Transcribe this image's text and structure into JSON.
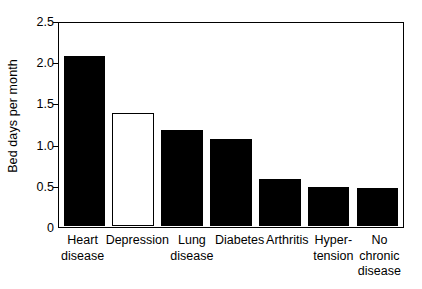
{
  "chart_data": {
    "type": "bar",
    "title": "",
    "subtitle": "",
    "xlabel": "",
    "ylabel": "Bed days per month",
    "ylim": [
      0,
      2.5
    ],
    "ytick_labels": [
      "2.5",
      "2.0",
      "1.5",
      "1.0",
      "0.5",
      "0"
    ],
    "ytick_values": [
      2.5,
      2.0,
      1.5,
      1.0,
      0.5,
      0
    ],
    "grid": false,
    "legend": null,
    "categories": [
      "Heart\ndisease",
      "Depression",
      "Lung\ndisease",
      "Diabetes",
      "Arthritis",
      "Hyper-\ntension",
      "No\nchronic\ndisease"
    ],
    "values": [
      2.1,
      1.4,
      1.19,
      1.08,
      0.58,
      0.48,
      0.47
    ],
    "bar_styles": [
      "filled",
      "open",
      "filled",
      "filled",
      "filled",
      "filled",
      "filled"
    ],
    "colors": {
      "bar_fill": "#000000",
      "bar_open_fill": "#ffffff",
      "bar_edge": "#000000",
      "axis": "#000000",
      "background": "#ffffff"
    }
  }
}
